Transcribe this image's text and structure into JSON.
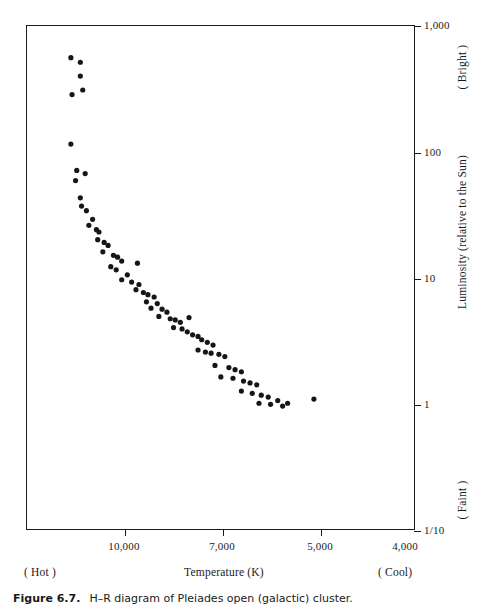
{
  "caption": {
    "number": "Figure 6.7.",
    "text": "H–R diagram of Pleiades open (galactic) cluster."
  },
  "axes": {
    "x_title": "Temperature (K)",
    "x_left_note": "( Hot )",
    "x_right_note": "( Cool)",
    "y_title": "Luminosity (relative to the Sun)",
    "y_top_note": "( Bright )",
    "y_bottom_note": "( Faint )"
  },
  "chart_data": {
    "type": "scatter",
    "title": "H–R diagram of Pleiades open (galactic) cluster.",
    "xlabel": "Temperature (K)",
    "ylabel": "Luminosity (relative to the Sun)",
    "xscale": "log-reversed",
    "yscale": "log",
    "xlim": [
      13600,
      3700
    ],
    "ylim": [
      0.1,
      1000
    ],
    "grid": false,
    "legend": null,
    "xticks": [
      {
        "value": 10000,
        "label": "10,000",
        "pixel_x": 124
      },
      {
        "value": 7000,
        "label": "7,000",
        "pixel_x": 222
      },
      {
        "value": 5000,
        "label": "5,000",
        "pixel_x": 320
      },
      {
        "value": 4000,
        "label": "4,000",
        "pixel_x": 405
      }
    ],
    "yticks": [
      {
        "value": 1000,
        "label": "1,000",
        "pixel_y": 25
      },
      {
        "value": 100,
        "label": "100",
        "pixel_y": 152
      },
      {
        "value": 10,
        "label": "10",
        "pixel_y": 278
      },
      {
        "value": 1,
        "label": "1",
        "pixel_y": 404
      },
      {
        "value": 0.1,
        "label": "1/10",
        "pixel_y": 530
      }
    ],
    "point_count": 76,
    "marker": {
      "shape": "circle",
      "radius_px": 2.6,
      "color": "#161616"
    },
    "points": [
      {
        "x": 12100,
        "y": 560
      },
      {
        "x": 11700,
        "y": 515
      },
      {
        "x": 11700,
        "y": 400
      },
      {
        "x": 11600,
        "y": 310
      },
      {
        "x": 12050,
        "y": 285
      },
      {
        "x": 12100,
        "y": 115
      },
      {
        "x": 11850,
        "y": 71
      },
      {
        "x": 11500,
        "y": 67
      },
      {
        "x": 11900,
        "y": 59
      },
      {
        "x": 11700,
        "y": 43
      },
      {
        "x": 11650,
        "y": 37
      },
      {
        "x": 11450,
        "y": 34
      },
      {
        "x": 11200,
        "y": 29
      },
      {
        "x": 11350,
        "y": 26
      },
      {
        "x": 11050,
        "y": 24
      },
      {
        "x": 10950,
        "y": 23
      },
      {
        "x": 11000,
        "y": 20
      },
      {
        "x": 10750,
        "y": 19
      },
      {
        "x": 10600,
        "y": 18
      },
      {
        "x": 10800,
        "y": 16
      },
      {
        "x": 10400,
        "y": 15
      },
      {
        "x": 10250,
        "y": 14.5
      },
      {
        "x": 10100,
        "y": 13.5
      },
      {
        "x": 10500,
        "y": 12.2
      },
      {
        "x": 10300,
        "y": 11.5
      },
      {
        "x": 9550,
        "y": 13.0
      },
      {
        "x": 9900,
        "y": 10.5
      },
      {
        "x": 10100,
        "y": 9.6
      },
      {
        "x": 9750,
        "y": 9.2
      },
      {
        "x": 9500,
        "y": 8.8
      },
      {
        "x": 9600,
        "y": 8.0
      },
      {
        "x": 9350,
        "y": 7.6
      },
      {
        "x": 9200,
        "y": 7.3
      },
      {
        "x": 9000,
        "y": 7.0
      },
      {
        "x": 9250,
        "y": 6.4
      },
      {
        "x": 8900,
        "y": 6.2
      },
      {
        "x": 9100,
        "y": 5.7
      },
      {
        "x": 8750,
        "y": 5.6
      },
      {
        "x": 8600,
        "y": 5.3
      },
      {
        "x": 8850,
        "y": 4.9
      },
      {
        "x": 8500,
        "y": 4.7
      },
      {
        "x": 8350,
        "y": 4.6
      },
      {
        "x": 8200,
        "y": 4.4
      },
      {
        "x": 7950,
        "y": 4.8
      },
      {
        "x": 8400,
        "y": 4.0
      },
      {
        "x": 8150,
        "y": 3.9
      },
      {
        "x": 8000,
        "y": 3.7
      },
      {
        "x": 7850,
        "y": 3.5
      },
      {
        "x": 7700,
        "y": 3.4
      },
      {
        "x": 7600,
        "y": 3.2
      },
      {
        "x": 7450,
        "y": 3.05
      },
      {
        "x": 7300,
        "y": 2.9
      },
      {
        "x": 7700,
        "y": 2.65
      },
      {
        "x": 7500,
        "y": 2.55
      },
      {
        "x": 7350,
        "y": 2.5
      },
      {
        "x": 7150,
        "y": 2.45
      },
      {
        "x": 7000,
        "y": 2.35
      },
      {
        "x": 7250,
        "y": 2.0
      },
      {
        "x": 6900,
        "y": 1.92
      },
      {
        "x": 6750,
        "y": 1.85
      },
      {
        "x": 6600,
        "y": 1.78
      },
      {
        "x": 7100,
        "y": 1.62
      },
      {
        "x": 6800,
        "y": 1.58
      },
      {
        "x": 6550,
        "y": 1.5
      },
      {
        "x": 6400,
        "y": 1.45
      },
      {
        "x": 6250,
        "y": 1.4
      },
      {
        "x": 6600,
        "y": 1.25
      },
      {
        "x": 6350,
        "y": 1.2
      },
      {
        "x": 6150,
        "y": 1.16
      },
      {
        "x": 6000,
        "y": 1.12
      },
      {
        "x": 6200,
        "y": 1.0
      },
      {
        "x": 5950,
        "y": 0.98
      },
      {
        "x": 5800,
        "y": 1.05
      },
      {
        "x": 5700,
        "y": 0.95
      },
      {
        "x": 5600,
        "y": 1.0
      },
      {
        "x": 5100,
        "y": 1.08
      }
    ]
  }
}
